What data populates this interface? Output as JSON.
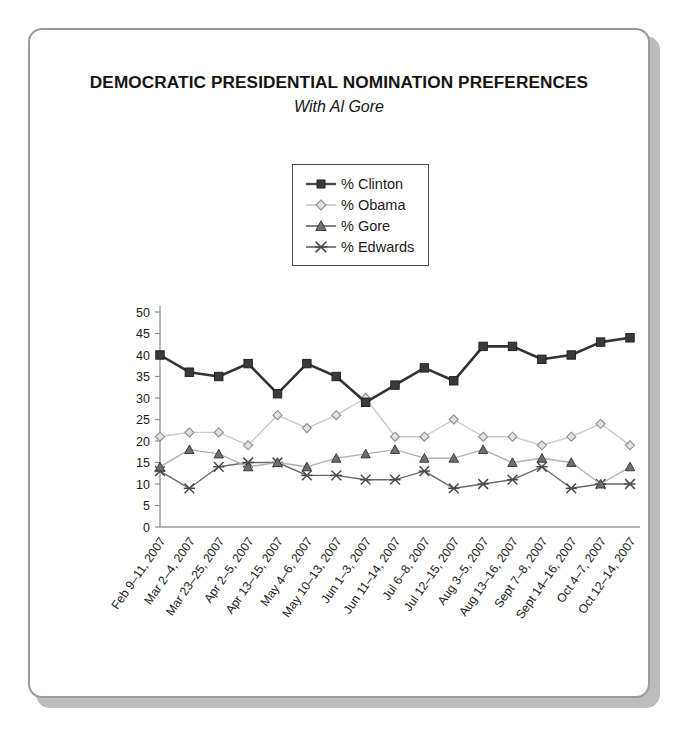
{
  "card": {
    "title": "DEMOCRATIC PRESIDENTIAL NOMINATION PREFERENCES",
    "subtitle": "With Al Gore"
  },
  "legend": {
    "items": [
      {
        "label": "% Clinton",
        "marker": "filled-square",
        "color": "#333333"
      },
      {
        "label": "% Obama",
        "marker": "open-diamond",
        "color": "#b5b5b5"
      },
      {
        "label": "% Gore",
        "marker": "filled-triangle",
        "color": "#666666"
      },
      {
        "label": "% Edwards",
        "marker": "asterisk",
        "color": "#555555"
      }
    ]
  },
  "chart_data": {
    "type": "line",
    "title": "DEMOCRATIC PRESIDENTIAL NOMINATION PREFERENCES",
    "subtitle": "With Al Gore",
    "xlabel": "",
    "ylabel": "",
    "ylim": [
      0,
      50
    ],
    "ytick_step": 5,
    "yticks": [
      0,
      5,
      10,
      15,
      20,
      25,
      30,
      35,
      40,
      45,
      50
    ],
    "grid": false,
    "legend_position": "top-center",
    "categories": [
      "Feb 9–11, 2007",
      "Mar 2–4, 2007",
      "Mar 23–25, 2007",
      "Apr 2–5, 2007",
      "Apr 13–15, 2007",
      "May 4–6, 2007",
      "May 10–13, 2007",
      "Jun 1–3, 2007",
      "Jun 11–14, 2007",
      "Jul 6–8, 2007",
      "Jul 12–15, 2007",
      "Aug 3–5, 2007",
      "Aug 13–16, 2007",
      "Sept 7–8, 2007",
      "Sept 14–16, 2007",
      "Oct 4–7, 2007",
      "Oct 12–14, 2007"
    ],
    "series": [
      {
        "name": "% Clinton",
        "marker": "filled-square",
        "color": "#333333",
        "values": [
          40,
          36,
          35,
          38,
          31,
          38,
          35,
          29,
          33,
          37,
          34,
          42,
          42,
          39,
          40,
          43,
          44
        ]
      },
      {
        "name": "% Obama",
        "marker": "open-diamond",
        "color": "#b5b5b5",
        "values": [
          21,
          22,
          22,
          19,
          26,
          23,
          26,
          30,
          21,
          21,
          25,
          21,
          21,
          19,
          21,
          24,
          19
        ]
      },
      {
        "name": "% Gore",
        "marker": "filled-triangle",
        "color": "#8a8a8a",
        "values": [
          14,
          18,
          17,
          14,
          15,
          14,
          16,
          17,
          18,
          16,
          16,
          18,
          15,
          16,
          15,
          10,
          14
        ]
      },
      {
        "name": "% Edwards",
        "marker": "asterisk",
        "color": "#555555",
        "values": [
          13,
          9,
          14,
          15,
          15,
          12,
          12,
          11,
          11,
          13,
          9,
          10,
          11,
          14,
          9,
          10,
          10
        ]
      }
    ]
  }
}
